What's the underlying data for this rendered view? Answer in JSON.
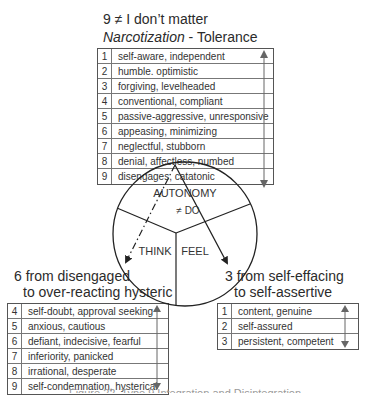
{
  "top": {
    "title": "9 ≠ I don’t matter",
    "subtitle_italic": "Narcotization",
    "subtitle_rest": " - Tolerance",
    "rows": [
      {
        "n": "1",
        "text": "self-aware, independent"
      },
      {
        "n": "2",
        "text": "humble. optimistic"
      },
      {
        "n": "3",
        "text": "forgiving, levelheaded"
      },
      {
        "n": "4",
        "text": "conventional, compliant"
      },
      {
        "n": "5",
        "text": "passive-aggressive, unresponsive"
      },
      {
        "n": "6",
        "text": "appeasing, minimizing"
      },
      {
        "n": "7",
        "text": "neglectful, stubborn"
      },
      {
        "n": "8",
        "text": "denial, affectless, numbed"
      },
      {
        "n": "9",
        "text": "disengages, catatonic"
      }
    ]
  },
  "circle": {
    "top_label": "AUTONOMY",
    "top_sub": "≠ DO",
    "left_label": "THINK",
    "right_label": "FEEL"
  },
  "left": {
    "title_line1": "6 from disengaged",
    "title_line2": "to over-reacting hysteric",
    "rows": [
      {
        "n": "4",
        "text": "self-doubt, approval seeking"
      },
      {
        "n": "5",
        "text": "anxious, cautious"
      },
      {
        "n": "6",
        "text": "defiant, indecisive, fearful"
      },
      {
        "n": "7",
        "text": "inferiority, panicked"
      },
      {
        "n": "8",
        "text": "irrational, desperate"
      },
      {
        "n": "9",
        "text": "self-condemnation, hysterical"
      }
    ]
  },
  "right": {
    "title_line1": "3 from self-effacing",
    "title_line2": "to self-assertive",
    "rows": [
      {
        "n": "1",
        "text": "content, genuine"
      },
      {
        "n": "2",
        "text": "self-assured"
      },
      {
        "n": "3",
        "text": "persistent, competent"
      }
    ]
  },
  "caption": "Figure 22. Type 9 Integration and Disintegration"
}
